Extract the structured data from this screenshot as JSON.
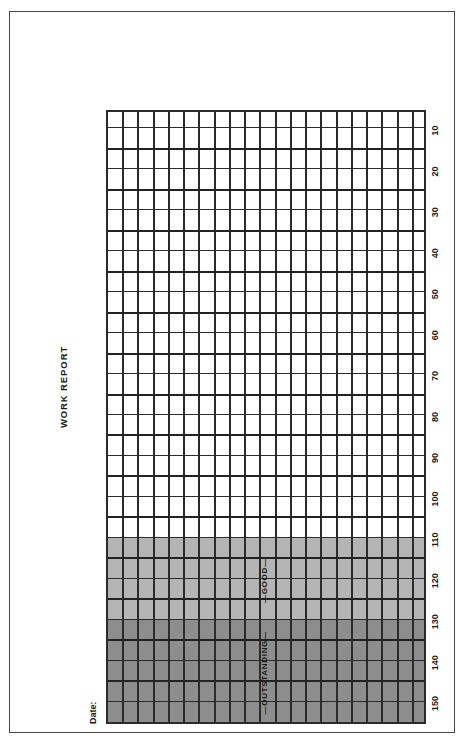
{
  "page": {
    "title": "WORK REPORT",
    "date_label": "Date:"
  },
  "bands": [
    {
      "label": "OUTSTANDING",
      "color": "#8d8d8d",
      "from": 150,
      "to": 125
    },
    {
      "label": "GOOD",
      "color": "#b4b4b4",
      "from": 125,
      "to": 105
    },
    {
      "label": "",
      "color": "#ffffff",
      "from": 105,
      "to": 0
    }
  ],
  "chart_data": {
    "type": "table",
    "title": "WORK REPORT",
    "xlabel": "",
    "ylabel": "",
    "orientation": "rotated-90",
    "scale_min": 5,
    "scale_max": 150,
    "minor_step": 5,
    "major_step": 10,
    "columns": 30,
    "rows": 21,
    "grid": true,
    "tick_labels": [
      "150",
      "140",
      "130",
      "120",
      "110",
      "100",
      "90",
      "80",
      "70",
      "60",
      "50",
      "40",
      "30",
      "20",
      "10"
    ],
    "tick_values": [
      150,
      140,
      130,
      120,
      110,
      100,
      90,
      80,
      70,
      60,
      50,
      40,
      30,
      20,
      10
    ],
    "shaded_regions": [
      {
        "name": "OUTSTANDING",
        "value_from": 150,
        "value_to": 125,
        "fill": "#8d8d8d"
      },
      {
        "name": "GOOD",
        "value_from": 125,
        "value_to": 105,
        "fill": "#b4b4b4"
      },
      {
        "name": "UNSHADED",
        "value_from": 105,
        "value_to": 5,
        "fill": "#ffffff"
      }
    ],
    "series": [],
    "values": [],
    "annotations": [
      "OUTSTANDING",
      "GOOD"
    ]
  },
  "colors": {
    "ink": "#1a1a1a",
    "rule": "#2b2b2b",
    "frame": "#4a4a4a",
    "band_dark": "#8d8d8d",
    "band_light": "#b4b4b4",
    "paper": "#ffffff"
  }
}
